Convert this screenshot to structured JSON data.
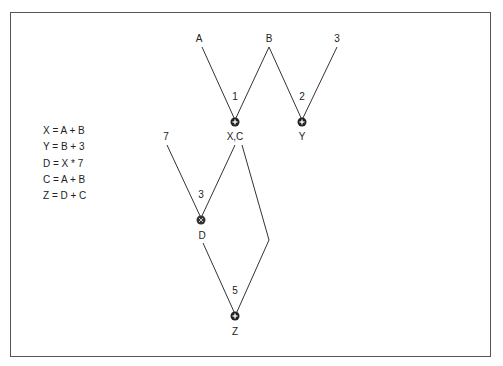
{
  "equations": [
    "X = A + B",
    "Y = B + 3",
    "D = X * 7",
    "C = A + B",
    "Z = D + C"
  ],
  "inputs": {
    "a": {
      "label": "A",
      "x": 199,
      "y": 42
    },
    "b": {
      "label": "B",
      "x": 269,
      "y": 42
    },
    "three": {
      "label": "3",
      "x": 337,
      "y": 42
    },
    "seven": {
      "label": "7",
      "x": 166,
      "y": 140
    }
  },
  "nodes": {
    "xc": {
      "label": "X,C",
      "op": "+",
      "step": "1",
      "x": 235,
      "y": 122
    },
    "y": {
      "label": "Y",
      "op": "+",
      "step": "2",
      "x": 302,
      "y": 122
    },
    "d": {
      "label": "D",
      "op": "*",
      "step": "3",
      "x": 201,
      "y": 220
    },
    "z": {
      "label": "Z",
      "op": "+",
      "step": "5",
      "x": 235,
      "y": 316
    }
  },
  "colors": {
    "line": "#333333",
    "node": "#222222",
    "frame": "#555555"
  }
}
